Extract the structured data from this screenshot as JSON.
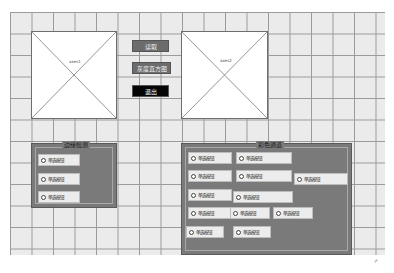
{
  "axes": [
    {
      "label": "axes1"
    },
    {
      "label": "axes2"
    }
  ],
  "buttons": {
    "read": "读取",
    "histogram": "灰度直方图",
    "exit": "退出"
  },
  "edge_panel": {
    "title": "边缘检测",
    "options": [
      "单选按钮",
      "单选按钮",
      "单选按钮"
    ]
  },
  "color_panel": {
    "title": "彩色通道",
    "options": [
      "单选按钮",
      "单选按钮",
      "单选按钮",
      "单选按钮",
      "单选按钮",
      "单选按钮",
      "单选按钮",
      "单选按钮",
      "单选按钮",
      "单选按钮",
      "单选按钮"
    ]
  },
  "colors": {
    "grid_bg": "#ebebeb",
    "grid_line": "#9a9a9a",
    "panel_bg": "#7a7a7a",
    "button_gray": "#6c6c6c",
    "button_black": "#050505"
  },
  "corner_marker": "↱"
}
